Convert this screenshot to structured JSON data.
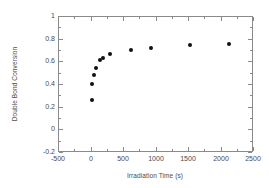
{
  "chart_data": {
    "type": "scatter",
    "title": "",
    "xlabel": "Irradiation Time (s)",
    "ylabel": "Double Bond Conversion",
    "xlim": [
      -500,
      2500
    ],
    "ylim": [
      -0.2,
      1.0
    ],
    "xticks": [
      -500,
      0,
      500,
      1000,
      1500,
      2000,
      2500
    ],
    "xticklabels": [
      "-500",
      "0",
      "500",
      "1000",
      "1500",
      "2000",
      "2500"
    ],
    "yticks": [
      -0.2,
      0,
      0.2,
      0.4,
      0.6,
      0.8,
      1.0
    ],
    "yticklabels": [
      "-0.2",
      "0",
      "0.2",
      "0.4",
      "0.6",
      "0.8",
      "1"
    ],
    "grid": false,
    "legend": null,
    "marker": "filled-circle",
    "marker_color": "#111111",
    "series": [
      {
        "name": "Double Bond Conversion",
        "x": [
          30,
          30,
          60,
          90,
          150,
          190,
          300,
          620,
          930,
          1530,
          2130
        ],
        "y": [
          0.26,
          0.4,
          0.48,
          0.54,
          0.61,
          0.63,
          0.665,
          0.7,
          0.72,
          0.74,
          0.75
        ]
      }
    ]
  },
  "figure": {
    "background_color": "#ffffff",
    "frame_color": "#8a8a8a",
    "text_color": "#4a4a4a"
  }
}
